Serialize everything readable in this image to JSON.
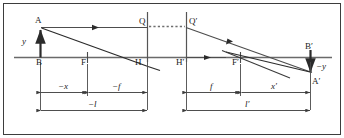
{
  "figure": {
    "border_color": "#3d3d3d",
    "line_color": "#555555",
    "ray_color": "#2b2b2b",
    "text_color": "#1a1a1a"
  },
  "points": {
    "A": "A",
    "B": "B",
    "F": "F",
    "H": "H",
    "Q": "Q",
    "Q_prime": "Q′",
    "H_prime": "H′",
    "F_prime": "F′",
    "B_prime": "B′",
    "A_prime": "A′"
  },
  "heights": {
    "object": "y",
    "image": "−y"
  },
  "dimensions": {
    "minus_x": "−x",
    "minus_f": "−f",
    "f_prime": "f",
    "x_prime": "x′",
    "minus_l": "−l",
    "l_prime": "l′"
  }
}
